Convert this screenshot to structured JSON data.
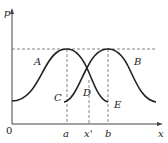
{
  "diagram": {
    "y_axis_label": "p",
    "x_axis_label": "x",
    "origin_label": "0",
    "curve_labels": {
      "A": "A",
      "B": "B",
      "C": "C",
      "D": "D",
      "E": "E"
    },
    "x_ticks": {
      "a": "a",
      "x_prime": "x'",
      "b": "b"
    },
    "colors": {
      "curve": "#222222",
      "axis": "#444444",
      "dashed": "#666666"
    }
  }
}
